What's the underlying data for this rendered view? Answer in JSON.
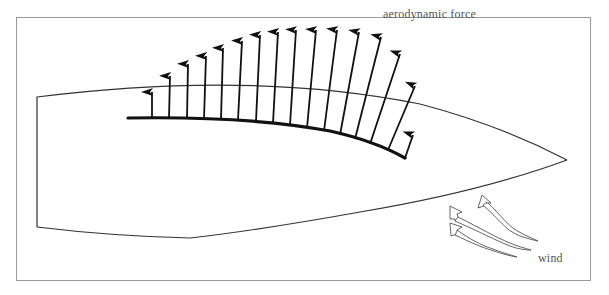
{
  "diagram": {
    "type": "sail-force-diagram",
    "labels": {
      "force": "aerodynamic force",
      "wind": "wind"
    },
    "colors": {
      "background": "#ffffff",
      "frame": "#9a9a9a",
      "hull": "#333333",
      "sail": "#111111",
      "arrow": "#111111",
      "label": "#555555"
    },
    "frame": {
      "x": 16,
      "y": 17,
      "width": 575,
      "height": 264
    },
    "hull": {
      "transom_top": [
        37,
        97
      ],
      "transom_bottom": [
        37,
        227
      ],
      "bow": [
        567,
        160
      ]
    },
    "sail": {
      "foot": [
        [
          128,
          118
        ],
        [
          250,
          121
        ],
        [
          340,
          135
        ],
        [
          405,
          158
        ]
      ]
    },
    "force_arrows": [
      {
        "base": [
          152,
          118
        ],
        "tip": [
          152,
          92
        ]
      },
      {
        "base": [
          169,
          118
        ],
        "tip": [
          170,
          76
        ]
      },
      {
        "base": [
          187,
          118
        ],
        "tip": [
          188,
          64
        ]
      },
      {
        "base": [
          204,
          119
        ],
        "tip": [
          206,
          56
        ]
      },
      {
        "base": [
          221,
          119
        ],
        "tip": [
          223,
          48
        ]
      },
      {
        "base": [
          238,
          120
        ],
        "tip": [
          242,
          41
        ]
      },
      {
        "base": [
          256,
          121
        ],
        "tip": [
          260,
          35
        ]
      },
      {
        "base": [
          273,
          123
        ],
        "tip": [
          278,
          32
        ]
      },
      {
        "base": [
          290,
          125
        ],
        "tip": [
          296,
          30
        ]
      },
      {
        "base": [
          307,
          128
        ],
        "tip": [
          316,
          30
        ]
      },
      {
        "base": [
          324,
          131
        ],
        "tip": [
          337,
          30
        ]
      },
      {
        "base": [
          340,
          135
        ],
        "tip": [
          359,
          32
        ]
      },
      {
        "base": [
          355,
          139
        ],
        "tip": [
          381,
          37
        ]
      },
      {
        "base": [
          370,
          144
        ],
        "tip": [
          400,
          54
        ]
      },
      {
        "base": [
          388,
          150
        ],
        "tip": [
          415,
          86
        ]
      },
      {
        "base": [
          405,
          158
        ],
        "tip": [
          413,
          135
        ]
      }
    ],
    "wind_arrows": 3
  }
}
